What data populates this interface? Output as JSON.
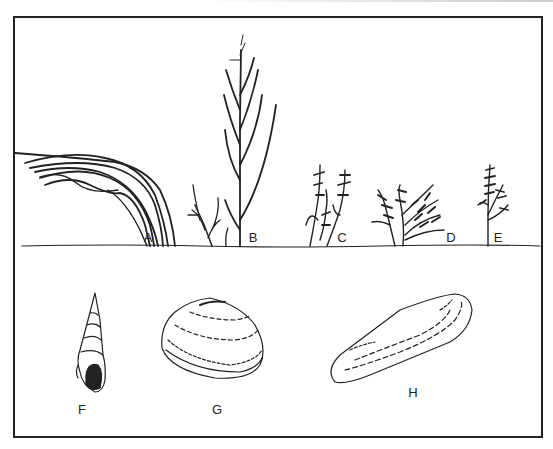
{
  "figure": {
    "type": "scientific-illustration",
    "plants": [
      {
        "label": "A",
        "form": "arching grass blades",
        "x": 148,
        "y": 237
      },
      {
        "label": "B",
        "form": "tall branching erect stem",
        "x": 253,
        "y": 237
      },
      {
        "label": "C",
        "form": "jointed succulent stems",
        "x": 342,
        "y": 237
      },
      {
        "label": "D",
        "form": "spreading bushy succulent",
        "x": 451,
        "y": 237
      },
      {
        "label": "E",
        "form": "small upright feathery sprig",
        "x": 498,
        "y": 237
      }
    ],
    "shells": [
      {
        "label": "F",
        "form": "tall spiral snail shell",
        "x": 82,
        "y": 409
      },
      {
        "label": "G",
        "form": "rounded clam shell",
        "x": 217,
        "y": 409
      },
      {
        "label": "H",
        "form": "elongated razor-like shell",
        "x": 413,
        "y": 392
      }
    ],
    "colors": {
      "ink": "#222222",
      "paper": "#ffffff"
    }
  }
}
